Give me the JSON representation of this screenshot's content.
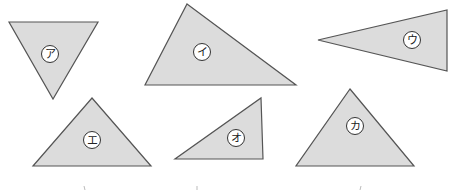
{
  "figure": {
    "width": 464,
    "height": 190,
    "fill_color": "#dcdcdc",
    "stroke_color": "#555555",
    "triangles": [
      {
        "id": "a",
        "label": "ア",
        "points": "9,22 98,22 53,99",
        "label_x": 50,
        "label_y": 54
      },
      {
        "id": "i",
        "label": "イ",
        "points": "187,4 296,85 145,85",
        "label_x": 202,
        "label_y": 52
      },
      {
        "id": "u",
        "label": "ウ",
        "points": "318,40 447,10 447,71",
        "label_x": 412,
        "label_y": 40
      },
      {
        "id": "e",
        "label": "エ",
        "points": "92,98 151,166 33,166",
        "label_x": 92,
        "label_y": 140
      },
      {
        "id": "o",
        "label": "オ",
        "points": "261,98 263,159 175,159",
        "label_x": 236,
        "label_y": 138
      },
      {
        "id": "ka",
        "label": "カ",
        "points": "350,89 414,166 296,166",
        "label_x": 355,
        "label_y": 126
      }
    ]
  }
}
